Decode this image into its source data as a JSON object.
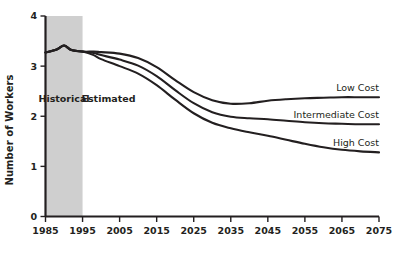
{
  "chart_data": {
    "type": "line",
    "title": "",
    "xlabel": "",
    "ylabel": "Number of Workers",
    "xlim": [
      1985,
      2075
    ],
    "ylim": [
      0,
      4
    ],
    "grid": false,
    "legend_position": "right-inline",
    "x_ticks": [
      "1985",
      "1995",
      "2005",
      "2015",
      "2025",
      "2035",
      "2045",
      "2055",
      "2065",
      "2075"
    ],
    "y_ticks": [
      "0",
      "1",
      "2",
      "3",
      "4"
    ],
    "annotations": [
      {
        "text": "Historical",
        "x": 1990,
        "y": 2.28
      },
      {
        "text": "Estimated",
        "x": 2002,
        "y": 2.28
      }
    ],
    "shaded_regions": [
      {
        "label": "Historical",
        "x_start": 1985,
        "x_end": 1995,
        "color": "#cfcfcf"
      }
    ],
    "series": [
      {
        "name": "Low Cost",
        "label": "Low Cost",
        "color": "#231f20",
        "x": [
          1985,
          1988,
          1990,
          1992,
          1995,
          1998,
          2000,
          2005,
          2010,
          2015,
          2020,
          2025,
          2030,
          2035,
          2040,
          2045,
          2050,
          2055,
          2060,
          2065,
          2070,
          2075
        ],
        "values": [
          3.27,
          3.33,
          3.41,
          3.32,
          3.29,
          3.29,
          3.28,
          3.25,
          3.16,
          2.98,
          2.72,
          2.48,
          2.32,
          2.25,
          2.26,
          2.31,
          2.34,
          2.36,
          2.37,
          2.38,
          2.38,
          2.38
        ]
      },
      {
        "name": "Intermediate Cost",
        "label": "Intermediate Cost",
        "color": "#231f20",
        "x": [
          1985,
          1988,
          1990,
          1992,
          1995,
          1998,
          2000,
          2005,
          2010,
          2015,
          2020,
          2025,
          2030,
          2035,
          2040,
          2045,
          2050,
          2055,
          2060,
          2065,
          2070,
          2075
        ],
        "values": [
          3.27,
          3.33,
          3.41,
          3.32,
          3.29,
          3.26,
          3.22,
          3.13,
          3.01,
          2.8,
          2.52,
          2.26,
          2.08,
          1.99,
          1.96,
          1.94,
          1.91,
          1.88,
          1.86,
          1.85,
          1.84,
          1.84
        ]
      },
      {
        "name": "High Cost",
        "label": "High Cost",
        "color": "#231f20",
        "x": [
          1985,
          1988,
          1990,
          1992,
          1995,
          1998,
          2000,
          2005,
          2010,
          2015,
          2020,
          2025,
          2030,
          2035,
          2040,
          2045,
          2050,
          2055,
          2060,
          2065,
          2070,
          2075
        ],
        "values": [
          3.27,
          3.33,
          3.41,
          3.32,
          3.29,
          3.22,
          3.14,
          3.0,
          2.85,
          2.62,
          2.33,
          2.06,
          1.87,
          1.76,
          1.68,
          1.61,
          1.53,
          1.45,
          1.38,
          1.33,
          1.3,
          1.28
        ]
      }
    ]
  }
}
